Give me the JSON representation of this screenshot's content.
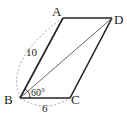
{
  "diagram": {
    "type": "parallelogram",
    "vertices": {
      "A": {
        "label": "A",
        "x": 63,
        "y": 18
      },
      "D": {
        "label": "D",
        "x": 112,
        "y": 18
      },
      "B": {
        "label": "B",
        "x": 20,
        "y": 98
      },
      "C": {
        "label": "C",
        "x": 70,
        "y": 98
      }
    },
    "edges": [
      "AB",
      "BC",
      "CD",
      "DA"
    ],
    "diagonal": "BD",
    "annotations": {
      "ab_length": "10",
      "bc_length": "6",
      "angle_b": "60°"
    },
    "colors": {
      "edge": "#222222",
      "diagonal": "#444444",
      "dashed_arc": "#999999"
    }
  }
}
